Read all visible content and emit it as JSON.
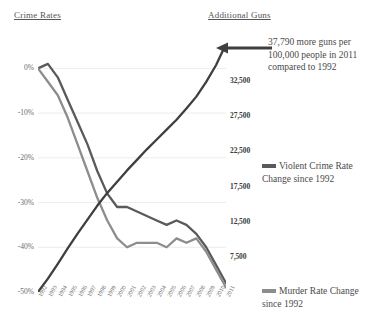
{
  "header": {
    "left_title": "Crime Rates",
    "right_title": "Additional Guns"
  },
  "annotation": {
    "text": "37,790 more guns per 100,000 people in 2011 compared to 1992",
    "arrow_icon": "left-arrow-icon"
  },
  "legend": {
    "violent": {
      "label": "Violent Crime Rate Change since 1992",
      "color": "#5a5a5a",
      "swatch_icon": "line-swatch-icon"
    },
    "murder": {
      "label": "Murder Rate Change since 1992",
      "color": "#8d8d8d",
      "swatch_icon": "line-swatch-icon"
    }
  },
  "chart_data": {
    "type": "line",
    "title": "",
    "xlabel": "",
    "ylabel": "Crime Rates",
    "y2label": "Additional Guns",
    "grid": true,
    "legend_position": "right",
    "ylim": [
      -50,
      5
    ],
    "y2lim": [
      2500,
      37500
    ],
    "yticks": [
      "0%",
      "-10%",
      "-20%",
      "-30%",
      "-40%",
      "-50%"
    ],
    "ytick_values": [
      0,
      -10,
      -20,
      -30,
      -40,
      -50
    ],
    "y2ticks": [
      "7,500",
      "12,500",
      "17,500",
      "22,500",
      "27,500",
      "32,500"
    ],
    "y2tick_values": [
      7500,
      12500,
      17500,
      22500,
      27500,
      32500
    ],
    "categories": [
      "1992",
      "1993",
      "1994",
      "1995",
      "1996",
      "1997",
      "1998",
      "1999",
      "2000",
      "2001",
      "2002",
      "2003",
      "2004",
      "2005",
      "2006",
      "2007",
      "2008",
      "2009",
      "2010",
      "2011"
    ],
    "series": [
      {
        "name": "Violent Crime Rate Change since 1992",
        "axis": "left",
        "units": "percent",
        "color": "#5a5a5a",
        "values": [
          0,
          1,
          -2,
          -7,
          -12,
          -17,
          -23,
          -28,
          -31,
          -31,
          -32,
          -33,
          -34,
          -35,
          -34,
          -35,
          -37,
          -40,
          -44,
          -48
        ]
      },
      {
        "name": "Murder Rate Change since 1992",
        "axis": "left",
        "units": "percent",
        "color": "#8d8d8d",
        "values": [
          0,
          -3,
          -6,
          -11,
          -17,
          -23,
          -29,
          -34,
          -38,
          -40,
          -39,
          -39,
          -39,
          -40,
          -38,
          -39,
          -38,
          -41,
          -45,
          -49
        ]
      },
      {
        "name": "Additional Guns",
        "axis": "right",
        "units": "guns per 100,000 people",
        "color": "#3f3f3f",
        "values": [
          2500,
          4400,
          6500,
          8700,
          10800,
          12800,
          14800,
          16600,
          18200,
          19800,
          21300,
          22800,
          24200,
          25600,
          27000,
          28600,
          30300,
          32400,
          34800,
          37790
        ]
      }
    ]
  }
}
